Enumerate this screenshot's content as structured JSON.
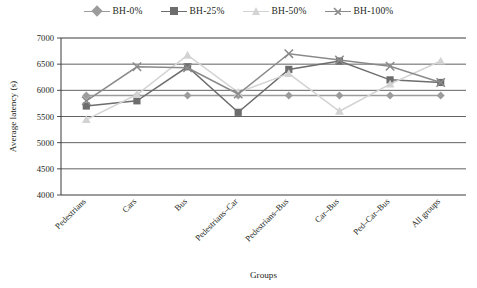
{
  "chart_data": {
    "type": "line",
    "title": "",
    "xlabel": "Groups",
    "ylabel": "Average latency (s)",
    "ylim": [
      4000,
      7000
    ],
    "yticks": [
      4000,
      4500,
      5000,
      5500,
      6000,
      6500,
      7000
    ],
    "grid": true,
    "legend_position": "top-center",
    "categories": [
      "Pedestrians",
      "Cars",
      "Bus",
      "Pedestrians–Car",
      "Pedestrians–Bus",
      "Car–Bus",
      "Ped–Car–Bus",
      "All groups"
    ],
    "series": [
      {
        "name": "BH-0%",
        "marker": "diamond",
        "color": "#9c9c9c",
        "values": [
          5900,
          5900,
          5900,
          5900,
          5900,
          5900,
          5900,
          5900
        ]
      },
      {
        "name": "BH-25%",
        "marker": "square",
        "color": "#6d6d6d",
        "values": [
          5700,
          5800,
          6450,
          5580,
          6400,
          6560,
          6200,
          6150
        ]
      },
      {
        "name": "BH-50%",
        "marker": "triangle",
        "color": "#d3d3d3",
        "values": [
          5440,
          5920,
          6670,
          5960,
          6320,
          5600,
          6120,
          6560
        ]
      },
      {
        "name": "BH-100%",
        "marker": "cross",
        "color": "#8a8a8a",
        "values": [
          5800,
          6450,
          6430,
          5930,
          6700,
          6580,
          6460,
          6150
        ]
      }
    ]
  },
  "legend": {
    "items": [
      {
        "label": "BH-0%"
      },
      {
        "label": "BH-25%"
      },
      {
        "label": "BH-50%"
      },
      {
        "label": "BH-100%"
      }
    ]
  },
  "axes": {
    "y_title": "Average latency (s)",
    "x_title": "Groups"
  }
}
